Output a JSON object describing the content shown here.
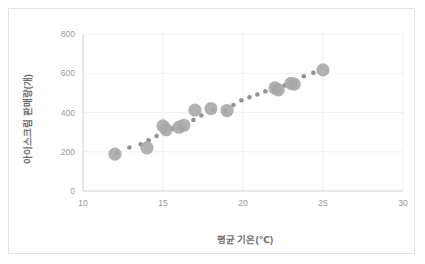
{
  "chart_data": {
    "type": "scatter",
    "title": "",
    "xlabel": "평균 기온(℃)",
    "ylabel": "아이스크림 판매량(개)",
    "xlim": [
      10,
      30
    ],
    "ylim": [
      0,
      800
    ],
    "xticks": [
      10,
      15,
      20,
      25,
      30
    ],
    "yticks": [
      0,
      200,
      400,
      600,
      800
    ],
    "xtick_labels": [
      "10",
      "15",
      "20",
      "25",
      "30"
    ],
    "ytick_labels": [
      "0",
      "200",
      "400",
      "600",
      "800"
    ],
    "grid": "horizontal-and-vertical",
    "legend": "none",
    "marker_color": "#a6a6a6",
    "trend_color": "#8c8c8c",
    "series": [
      {
        "name": "아이스크림 판매량",
        "marker": "large-circle",
        "points": [
          {
            "x": 12.0,
            "y": 188
          },
          {
            "x": 14.0,
            "y": 220
          },
          {
            "x": 15.0,
            "y": 332
          },
          {
            "x": 15.2,
            "y": 312
          },
          {
            "x": 16.0,
            "y": 325
          },
          {
            "x": 16.3,
            "y": 335
          },
          {
            "x": 17.0,
            "y": 412
          },
          {
            "x": 18.0,
            "y": 420
          },
          {
            "x": 19.0,
            "y": 410
          },
          {
            "x": 22.0,
            "y": 525
          },
          {
            "x": 22.2,
            "y": 515
          },
          {
            "x": 23.0,
            "y": 548
          },
          {
            "x": 23.2,
            "y": 545
          },
          {
            "x": 25.0,
            "y": 617
          }
        ]
      },
      {
        "name": "추세 표시",
        "marker": "small-dot",
        "points": [
          {
            "x": 12.1,
            "y": 192
          },
          {
            "x": 12.9,
            "y": 222
          },
          {
            "x": 13.6,
            "y": 238
          },
          {
            "x": 14.1,
            "y": 258
          },
          {
            "x": 14.6,
            "y": 280
          },
          {
            "x": 15.1,
            "y": 305
          },
          {
            "x": 15.6,
            "y": 318
          },
          {
            "x": 16.1,
            "y": 322
          },
          {
            "x": 16.9,
            "y": 362
          },
          {
            "x": 17.4,
            "y": 385
          },
          {
            "x": 18.1,
            "y": 412
          },
          {
            "x": 18.9,
            "y": 408
          },
          {
            "x": 19.4,
            "y": 438
          },
          {
            "x": 19.9,
            "y": 462
          },
          {
            "x": 20.4,
            "y": 478
          },
          {
            "x": 20.9,
            "y": 492
          },
          {
            "x": 21.4,
            "y": 508
          },
          {
            "x": 21.9,
            "y": 522
          },
          {
            "x": 22.6,
            "y": 538
          },
          {
            "x": 23.1,
            "y": 548
          },
          {
            "x": 23.8,
            "y": 585
          },
          {
            "x": 24.4,
            "y": 602
          }
        ]
      }
    ]
  }
}
